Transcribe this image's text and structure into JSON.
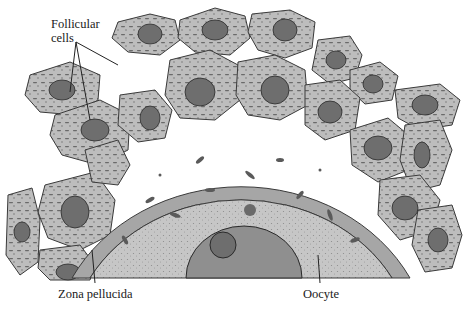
{
  "figure": {
    "labels": {
      "follicular_line1": "Follicular",
      "follicular_line2": "cells",
      "zona_pellucida": "Zona pellucida",
      "oocyte": "Oocyte"
    },
    "colors": {
      "background": "#ffffff",
      "cell_fill": "#b9b9b9",
      "cell_outline": "#3a3a3a",
      "nucleus_fill": "#6e6e6e",
      "oocyte_cytoplasm": "#c8c8c8",
      "oocyte_nucleus": "#8f8f8f",
      "zona": "#9a9a9a"
    }
  }
}
